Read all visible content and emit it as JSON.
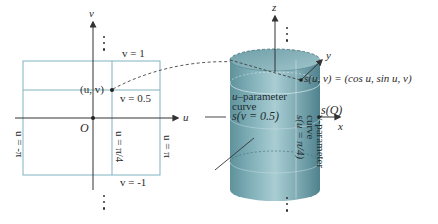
{
  "left_panel": {
    "axes": {
      "horizontal_label": "u",
      "vertical_label": "v",
      "origin_label": "O"
    },
    "lines": {
      "v_top": "v = 1",
      "v_mid": "v = 0.5",
      "v_bottom": "v = -1",
      "u_left": "u = -π",
      "u_mid": "u = π/4",
      "u_right": "u = π"
    },
    "point_label": "(u, v)"
  },
  "right_panel": {
    "axes": {
      "z_label": "z",
      "y_label": "y",
      "x_label": "x"
    },
    "mapping_label": "s(u, v) = (cos u, sin u, v)",
    "u_curve": {
      "title_u": "u",
      "title_rest": "–parameter",
      "line2": "curve",
      "line3": "s(v = 0.5)"
    },
    "v_curve": {
      "line1": "v-parameter",
      "line2": "curve",
      "line3": "s(u = π/4)"
    },
    "point_q_label": "s(Q)"
  },
  "colors": {
    "grid_line": "#7fb3bf",
    "cylinder_fill": "#7eaab3",
    "cylinder_dark": "#5d8f9a",
    "axis": "#333333"
  }
}
